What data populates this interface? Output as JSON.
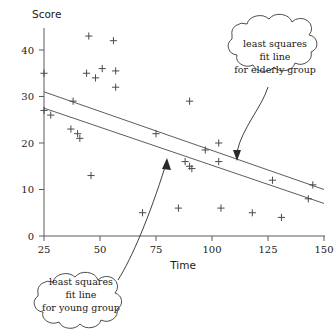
{
  "chart_data": {
    "type": "scatter",
    "title": "",
    "xlabel": "Time",
    "ylabel": "Score",
    "xlim": [
      25,
      150
    ],
    "ylim": [
      0,
      45
    ],
    "xticks": [
      25,
      50,
      75,
      100,
      125,
      150
    ],
    "yticks": [
      0,
      10,
      20,
      30,
      40
    ],
    "grid": false,
    "legend_position": "none",
    "marker": "plus",
    "points": [
      {
        "x": 45,
        "y": 43
      },
      {
        "x": 56,
        "y": 42
      },
      {
        "x": 51,
        "y": 36
      },
      {
        "x": 57,
        "y": 35.5
      },
      {
        "x": 44,
        "y": 35
      },
      {
        "x": 48,
        "y": 34
      },
      {
        "x": 57,
        "y": 32
      },
      {
        "x": 25,
        "y": 35
      },
      {
        "x": 38,
        "y": 29
      },
      {
        "x": 25,
        "y": 27
      },
      {
        "x": 28,
        "y": 26
      },
      {
        "x": 90,
        "y": 29
      },
      {
        "x": 37,
        "y": 23
      },
      {
        "x": 40,
        "y": 22
      },
      {
        "x": 75,
        "y": 22
      },
      {
        "x": 41,
        "y": 21
      },
      {
        "x": 103,
        "y": 20
      },
      {
        "x": 97,
        "y": 18.5
      },
      {
        "x": 88,
        "y": 16
      },
      {
        "x": 90,
        "y": 15
      },
      {
        "x": 91,
        "y": 14.5
      },
      {
        "x": 103,
        "y": 16
      },
      {
        "x": 127,
        "y": 12
      },
      {
        "x": 145,
        "y": 11
      },
      {
        "x": 46,
        "y": 13
      },
      {
        "x": 143,
        "y": 8
      },
      {
        "x": 69,
        "y": 5
      },
      {
        "x": 85,
        "y": 6
      },
      {
        "x": 104,
        "y": 6
      },
      {
        "x": 118,
        "y": 5
      },
      {
        "x": 131,
        "y": 4
      }
    ],
    "fit_lines": [
      {
        "name": "elderly",
        "label": "least squares fit line for elderly group",
        "x_start": 25,
        "y_start": 31,
        "x_end": 150,
        "y_end": 10
      },
      {
        "name": "young",
        "label": "least squares fit line for young group",
        "x_start": 25,
        "y_start": 27.5,
        "x_end": 150,
        "y_end": 7
      }
    ],
    "annotations": [
      {
        "id": "elderly-callout",
        "lines": [
          "least squares",
          "fit line",
          "for elderly group"
        ],
        "points_to_x": 112,
        "points_to_y": 16
      },
      {
        "id": "young-callout",
        "lines": [
          "least squares",
          "fit line",
          "for young group"
        ],
        "points_to_x": 79,
        "points_to_y": 17
      }
    ]
  },
  "labels": {
    "y_axis_title": "Score",
    "x_axis_title": "Time",
    "x_tick_labels": [
      "25",
      "50",
      "75",
      "100",
      "125",
      "150"
    ],
    "y_tick_labels": [
      "0",
      "10",
      "20",
      "30",
      "40"
    ]
  },
  "annotations": {
    "elderly": {
      "line1": "least squares",
      "line2": "fit line",
      "line3": "for elderly group"
    },
    "young": {
      "line1": "least squares",
      "line2": "fit line",
      "line3": "for young group"
    }
  },
  "colors": {
    "axis": "#5a5a5a",
    "marker": "#4a4a4a",
    "fit_line": "#4a4a4a",
    "callout_stroke": "#3a3a3a",
    "text": "#1a1a1a",
    "background": "#ffffff"
  }
}
